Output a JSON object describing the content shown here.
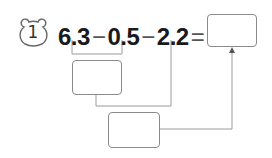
{
  "problem": {
    "number": "1",
    "badge_icon": "bear-head-icon",
    "expression": {
      "terms": [
        "6.3",
        "0.5",
        "2.2"
      ],
      "operators": [
        "−",
        "−"
      ],
      "equals": "="
    },
    "boxes": {
      "intermediate_1": "",
      "intermediate_2": "",
      "final_answer": ""
    }
  },
  "colors": {
    "text": "#1a1a1a",
    "lines": "#8a8a8a",
    "background": "#ffffff"
  }
}
